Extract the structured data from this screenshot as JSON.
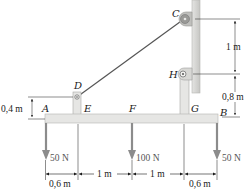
{
  "figure": {
    "type": "statics-frame-diagram",
    "points": {
      "A": "A",
      "B": "B",
      "C": "C",
      "D": "D",
      "E": "E",
      "F": "F",
      "G": "G",
      "H": "H"
    },
    "loads": [
      {
        "label": "50 N",
        "at": "A"
      },
      {
        "label": "100 N",
        "at": "F"
      },
      {
        "label": "50 N",
        "at": "B"
      }
    ],
    "horizontal_dimensions": [
      "0,6 m",
      "1 m",
      "1 m",
      "0,6 m"
    ],
    "vertical_dimensions": {
      "C_to_H": "1 m",
      "H_to_B": "0,8 m",
      "D_height": "0,4 m"
    },
    "colors": {
      "member_fill": "#e6e6e4",
      "member_stroke": "#a9a9a6",
      "wall": "#d3d3d0",
      "cable": "#555555",
      "force_arrow": "#8c8c8c",
      "ink": "#1a1a1a"
    }
  }
}
